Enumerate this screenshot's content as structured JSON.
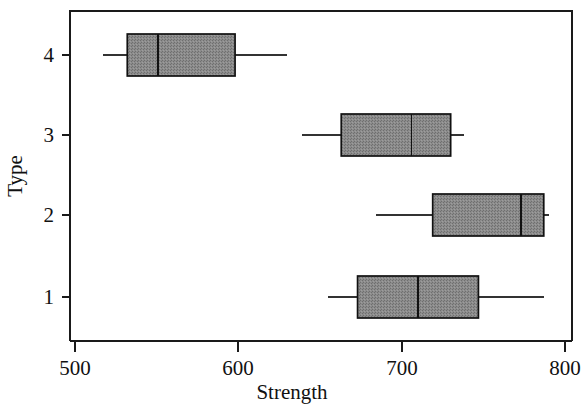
{
  "chart_data": {
    "type": "box",
    "title": "",
    "subtitle": "",
    "xlabel": "Strength",
    "ylabel": "Type",
    "orientation": "horizontal",
    "grid": false,
    "legend": "none",
    "xlim": [
      490,
      800
    ],
    "x_ticks": [
      500,
      600,
      700,
      800
    ],
    "x_tick_labels": [
      "500",
      "600",
      "700",
      "800"
    ],
    "y_categories": [
      "1",
      "2",
      "3",
      "4"
    ],
    "y_tick_labels": [
      "4",
      "3",
      "2",
      "1"
    ],
    "box_fill": "#8a8a8a",
    "box_stroke": "#111111",
    "axis_color": "#1a1a1a",
    "boxes": [
      {
        "category": "4",
        "whisker_low": 517,
        "q1": 532,
        "median": 551,
        "q3": 598,
        "whisker_high": 630
      },
      {
        "category": "3",
        "whisker_low": 639,
        "q1": 663,
        "median": 706,
        "q3": 730,
        "whisker_high": 738
      },
      {
        "category": "2",
        "whisker_low": 684,
        "q1": 719,
        "median": 773,
        "q3": 787,
        "whisker_high": 790
      },
      {
        "category": "1",
        "whisker_low": 655,
        "q1": 673,
        "median": 710,
        "q3": 747,
        "whisker_high": 787
      }
    ]
  },
  "axes": {
    "x_label": "Strength",
    "y_label": "Type",
    "x_ticks": [
      "500",
      "600",
      "700",
      "800"
    ],
    "y_ticks": [
      "4",
      "3",
      "2",
      "1"
    ]
  }
}
